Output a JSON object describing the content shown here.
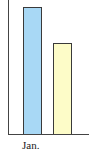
{
  "chart_data": {
    "type": "bar",
    "title": "",
    "xlabel": "",
    "ylabel": "",
    "categories": [
      "Jan."
    ],
    "series": [
      {
        "name": "Series 1",
        "values": [
          127
        ],
        "color": "#a8d8f5"
      },
      {
        "name": "Series 2",
        "values": [
          91
        ],
        "color": "#fdfcc8"
      }
    ],
    "grid": false,
    "legend": null
  },
  "labels": {
    "category_0": "Jan."
  },
  "colors": {
    "series1": "#a8d8f5",
    "series2": "#fdfcc8",
    "axis": "#444444"
  }
}
